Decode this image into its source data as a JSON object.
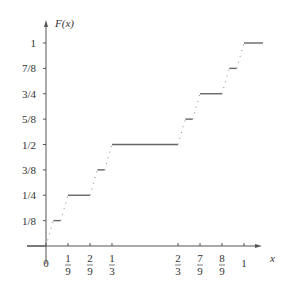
{
  "chart_data": {
    "type": "line",
    "title": "",
    "xlabel": "x",
    "ylabel": "F(x)",
    "x_ticks": [
      {
        "value": 0,
        "label": "0"
      },
      {
        "value": 0.1111,
        "label_num": "1",
        "label_den": "9"
      },
      {
        "value": 0.2222,
        "label_num": "2",
        "label_den": "9"
      },
      {
        "value": 0.3333,
        "label_num": "1",
        "label_den": "3"
      },
      {
        "value": 0.6667,
        "label_num": "2",
        "label_den": "3"
      },
      {
        "value": 0.7778,
        "label_num": "7",
        "label_den": "9"
      },
      {
        "value": 0.8889,
        "label_num": "8",
        "label_den": "9"
      },
      {
        "value": 1,
        "label": "1"
      }
    ],
    "y_ticks": [
      {
        "value": 0.125,
        "label": "1/8"
      },
      {
        "value": 0.25,
        "label": "1/4"
      },
      {
        "value": 0.375,
        "label": "3/8"
      },
      {
        "value": 0.5,
        "label": "1/2"
      },
      {
        "value": 0.625,
        "label": "5/8"
      },
      {
        "value": 0.75,
        "label": "3/4"
      },
      {
        "value": 0.875,
        "label": "7/8"
      },
      {
        "value": 1,
        "label": "1"
      }
    ],
    "flat_segments": [
      {
        "x0": -0.1,
        "x1": 0,
        "y": 0
      },
      {
        "x0": 0.037,
        "x1": 0.074,
        "y": 0.125
      },
      {
        "x0": 0.1111,
        "x1": 0.2222,
        "y": 0.25
      },
      {
        "x0": 0.2593,
        "x1": 0.2963,
        "y": 0.375
      },
      {
        "x0": 0.3333,
        "x1": 0.6667,
        "y": 0.5
      },
      {
        "x0": 0.7037,
        "x1": 0.7407,
        "y": 0.625
      },
      {
        "x0": 0.7778,
        "x1": 0.8889,
        "y": 0.75
      },
      {
        "x0": 0.9259,
        "x1": 0.963,
        "y": 0.875
      },
      {
        "x0": 1,
        "x1": 1.1,
        "y": 1
      }
    ],
    "xlim": [
      -0.1,
      1.1
    ],
    "ylim": [
      0,
      1.05
    ],
    "grid": false,
    "legend": null
  },
  "labels": {
    "x_axis": "x",
    "y_axis": "F(x)"
  }
}
